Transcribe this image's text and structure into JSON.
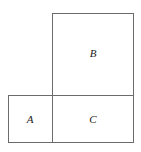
{
  "figure": {
    "background_color": "#ffffff",
    "stroke_color": "#6b6b6b",
    "label_color": "#1a1a1a",
    "width": 141,
    "height": 152
  },
  "chart_data": {
    "type": "diagram",
    "title": "",
    "subtitle": "",
    "xlabel": "",
    "ylabel": "",
    "grid": false,
    "legend": "none",
    "shapes": [
      {
        "label": "B",
        "type": "rectangle",
        "x": 52,
        "y": 13,
        "width": 82,
        "height": 83,
        "label_x": 93,
        "label_y": 53
      },
      {
        "label": "A",
        "type": "rectangle",
        "x": 8,
        "y": 95,
        "width": 45,
        "height": 48,
        "label_x": 30,
        "label_y": 119
      },
      {
        "label": "C",
        "type": "rectangle",
        "x": 52,
        "y": 95,
        "width": 82,
        "height": 48,
        "label_x": 93,
        "label_y": 119
      }
    ]
  }
}
